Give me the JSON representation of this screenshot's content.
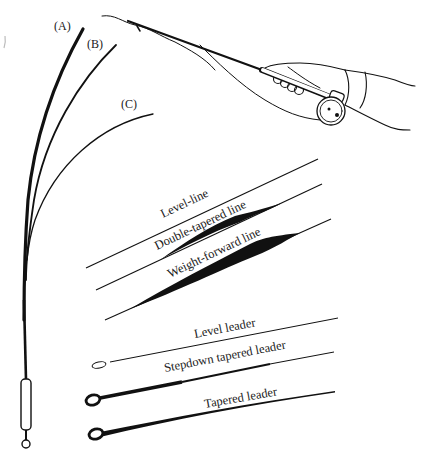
{
  "figure": {
    "type": "fly-fishing tackle illustration",
    "ink_color": "#111111",
    "background": "#ffffff"
  },
  "rod_flex": {
    "labels": [
      "(A)",
      "(B)",
      "(C)"
    ]
  },
  "fly_lines": {
    "labels": [
      "Level-line",
      "Double-tapered line",
      "Weight-forward line"
    ]
  },
  "leaders": {
    "labels": [
      "Level leader",
      "Stepdown tapered leader",
      "Tapered leader"
    ]
  }
}
